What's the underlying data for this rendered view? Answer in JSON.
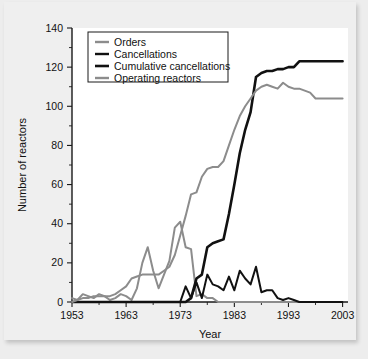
{
  "chart_data": {
    "type": "line",
    "title": "",
    "xlabel": "Year",
    "ylabel": "Number of reactors",
    "xlim": [
      1953,
      2004
    ],
    "ylim": [
      0,
      140
    ],
    "xticks": [
      1953,
      1963,
      1973,
      1983,
      1993,
      2003
    ],
    "yticks": [
      0,
      20,
      40,
      60,
      80,
      100,
      120,
      140
    ],
    "xtick_labels": [
      "1953",
      "1963",
      "1973",
      "1983",
      "1993",
      "2003"
    ],
    "ytick_labels": [
      "0",
      "20",
      "40",
      "60",
      "80",
      "100",
      "120",
      "140"
    ],
    "minor_ticks": true,
    "grid": false,
    "legend_position": "top-left",
    "x": [
      1953,
      1954,
      1955,
      1956,
      1957,
      1958,
      1959,
      1960,
      1961,
      1962,
      1963,
      1964,
      1965,
      1966,
      1967,
      1968,
      1969,
      1970,
      1971,
      1972,
      1973,
      1974,
      1975,
      1976,
      1977,
      1978,
      1979,
      1980,
      1981,
      1982,
      1983,
      1984,
      1985,
      1986,
      1987,
      1988,
      1989,
      1990,
      1991,
      1992,
      1993,
      1994,
      1995,
      1996,
      1997,
      1998,
      1999,
      2000,
      2001,
      2002,
      2003
    ],
    "series": [
      {
        "name": "Orders",
        "color": "#8c8c8c",
        "width": 2.0,
        "values": [
          2,
          1,
          4,
          3,
          2,
          4,
          3,
          1,
          2,
          4,
          3,
          1,
          7,
          20,
          28,
          16,
          7,
          14,
          21,
          38,
          41,
          28,
          27,
          3,
          4,
          2,
          2,
          0,
          0,
          0,
          0,
          0,
          0,
          0,
          0,
          0,
          0,
          0,
          0,
          0,
          0,
          0,
          0,
          0,
          0,
          0,
          0,
          0,
          0,
          0,
          0
        ]
      },
      {
        "name": "Cancellations",
        "color": "#111111",
        "width": 2.0,
        "values": [
          0,
          0,
          0,
          0,
          0,
          0,
          0,
          0,
          0,
          0,
          0,
          0,
          0,
          0,
          0,
          0,
          0,
          0,
          0,
          0,
          0,
          8,
          2,
          10,
          2,
          14,
          9,
          8,
          6,
          13,
          6,
          16,
          12,
          9,
          18,
          5,
          6,
          6,
          2,
          1,
          2,
          1,
          0,
          0,
          0,
          0,
          0,
          0,
          0,
          0,
          0
        ]
      },
      {
        "name": "Cumulative cancellations",
        "color": "#111111",
        "width": 2.6,
        "values": [
          0,
          0,
          0,
          0,
          0,
          0,
          0,
          0,
          0,
          0,
          0,
          0,
          0,
          0,
          0,
          0,
          0,
          0,
          0,
          0,
          0,
          0,
          2,
          12,
          14,
          28,
          30,
          31,
          32,
          45,
          60,
          76,
          88,
          97,
          115,
          117,
          118,
          118,
          119,
          119,
          120,
          120,
          123,
          123,
          123,
          123,
          123,
          123,
          123,
          123,
          123
        ]
      },
      {
        "name": "Operating reactors",
        "color": "#8c8c8c",
        "width": 2.0,
        "values": [
          0,
          1,
          2,
          2,
          3,
          3,
          3,
          3,
          4,
          6,
          8,
          12,
          13,
          14,
          14,
          14,
          14,
          16,
          18,
          24,
          34,
          44,
          55,
          56,
          64,
          68,
          69,
          69,
          72,
          80,
          88,
          95,
          100,
          104,
          108,
          110,
          111,
          110,
          109,
          112,
          110,
          109,
          109,
          108,
          107,
          104,
          104,
          104,
          104,
          104,
          104
        ]
      }
    ]
  },
  "legend": {
    "items": [
      {
        "label": "Orders"
      },
      {
        "label": "Cancellations"
      },
      {
        "label": "Cumulative cancellations"
      },
      {
        "label": "Operating reactors"
      }
    ]
  }
}
